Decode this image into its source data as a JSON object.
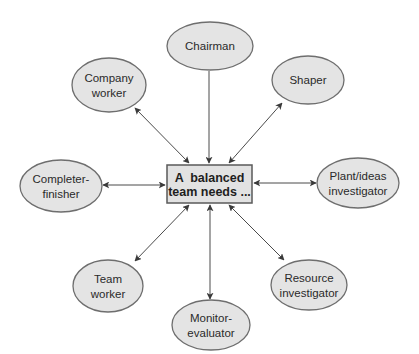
{
  "diagram": {
    "type": "hub-and-spoke",
    "center": {
      "lines": [
        "A  balanced",
        "team needs ..."
      ],
      "box": {
        "x": 167,
        "y": 165,
        "w": 85,
        "h": 38
      }
    },
    "nodes": [
      {
        "id": "chairman",
        "lines": [
          "Chairman"
        ],
        "cx": 210,
        "cy": 46,
        "rx": 43,
        "ry": 24
      },
      {
        "id": "company-worker",
        "lines": [
          "Company",
          "worker"
        ],
        "cx": 109,
        "cy": 85,
        "rx": 37,
        "ry": 27
      },
      {
        "id": "shaper",
        "lines": [
          "Shaper"
        ],
        "cx": 308,
        "cy": 80,
        "rx": 36,
        "ry": 24
      },
      {
        "id": "completer-finisher",
        "lines": [
          "Completer-",
          "finisher"
        ],
        "cx": 61,
        "cy": 186,
        "rx": 41,
        "ry": 26
      },
      {
        "id": "plant-ideas-investigator",
        "lines": [
          "Plant/ideas",
          "investigator"
        ],
        "cx": 358,
        "cy": 183,
        "rx": 41,
        "ry": 25
      },
      {
        "id": "team-worker",
        "lines": [
          "Team",
          "worker"
        ],
        "cx": 108,
        "cy": 286,
        "rx": 35,
        "ry": 26
      },
      {
        "id": "monitor-evaluator",
        "lines": [
          "Monitor-",
          "evaluator"
        ],
        "cx": 211,
        "cy": 325,
        "rx": 39,
        "ry": 25
      },
      {
        "id": "resource-investigator",
        "lines": [
          "Resource",
          "investigator"
        ],
        "cx": 309,
        "cy": 285,
        "rx": 38,
        "ry": 25
      }
    ],
    "edges": [
      {
        "to": "chairman",
        "x1": 209,
        "y1": 71,
        "x2": 209,
        "y2": 163,
        "start_arrow": false,
        "end_arrow": true
      },
      {
        "to": "company-worker",
        "x1": 135,
        "y1": 108,
        "x2": 189,
        "y2": 163,
        "start_arrow": true,
        "end_arrow": true
      },
      {
        "to": "shaper",
        "x1": 282,
        "y1": 103,
        "x2": 229,
        "y2": 163,
        "start_arrow": true,
        "end_arrow": true
      },
      {
        "to": "completer-finisher",
        "x1": 103,
        "y1": 185,
        "x2": 165,
        "y2": 185,
        "start_arrow": true,
        "end_arrow": true
      },
      {
        "to": "plant-ideas-investigator",
        "x1": 254,
        "y1": 183,
        "x2": 316,
        "y2": 183,
        "start_arrow": true,
        "end_arrow": true
      },
      {
        "to": "team-worker",
        "x1": 189,
        "y1": 205,
        "x2": 135,
        "y2": 261,
        "start_arrow": true,
        "end_arrow": true
      },
      {
        "to": "monitor-evaluator",
        "x1": 210,
        "y1": 205,
        "x2": 210,
        "y2": 299,
        "start_arrow": true,
        "end_arrow": true
      },
      {
        "to": "resource-investigator",
        "x1": 229,
        "y1": 205,
        "x2": 284,
        "y2": 260,
        "start_arrow": true,
        "end_arrow": true
      }
    ],
    "colors": {
      "node_fill": "#e4e4e4",
      "node_stroke": "#6e6e6e",
      "center_fill": "#e2e2e2",
      "center_stroke": "#5a5a5a",
      "arrow": "#4a4a4a",
      "text": "#2a2a2a"
    }
  }
}
